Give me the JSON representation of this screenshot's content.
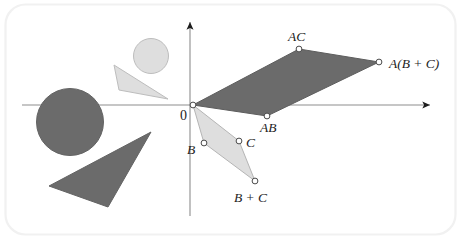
{
  "figure": {
    "kind": "geometric-diagram",
    "canvas": {
      "width": 462,
      "height": 240,
      "background": "#ffffff"
    },
    "frame": {
      "stroke": "#f0f0f0",
      "radius": 20,
      "x": 5,
      "y": 4,
      "width": 450,
      "height": 230
    }
  },
  "colors": {
    "dark_fill": "#6b6b6b",
    "dark_stroke": "#5d5d5d",
    "light_fill": "#dedede",
    "light_stroke": "#b8b8b8",
    "axis": "#8a8a8a",
    "axis_arrow": "#1d1d1d",
    "marker_fill": "#ffffff",
    "marker_stroke": "#4a4a4a",
    "label_color": "#1d1d1d"
  },
  "axes": {
    "x_axis": {
      "label": "",
      "from_x": 22,
      "to_x": 432,
      "y": 105,
      "arrow": "right"
    },
    "y_axis": {
      "label": "",
      "x": 190,
      "from_y": 216,
      "to_y": 20,
      "arrow": "up"
    },
    "origin": {
      "label": "0",
      "x": 193,
      "y": 105,
      "label_x": 180,
      "label_y": 119
    }
  },
  "shapes": [
    {
      "name": "light-circle",
      "type": "circle",
      "tone": "light",
      "cx": 151,
      "cy": 56,
      "r": 17.5
    },
    {
      "name": "light-triangle",
      "type": "triangle",
      "tone": "light",
      "points": "114,65 119,90 168,99"
    },
    {
      "name": "dark-circle",
      "type": "circle",
      "tone": "dark",
      "cx": 70,
      "cy": 122,
      "r": 33.5
    },
    {
      "name": "dark-triangle",
      "type": "triangle",
      "tone": "dark",
      "points": "151,132 49,186 108,207"
    }
  ],
  "parallelograms": [
    {
      "name": "dark-parallelogram",
      "tone": "dark",
      "points": "193,105 267,116 379,62 299,49",
      "vertices": [
        {
          "point_label": "AC",
          "x": 299,
          "y": 49,
          "label_x": 289,
          "label_y": 41,
          "anchor": "start"
        },
        {
          "point_label": "A(B + C)",
          "x": 379,
          "y": 62,
          "label_x": 389,
          "label_y": 67,
          "anchor": "start"
        },
        {
          "point_label": "AB",
          "x": 267,
          "y": 116,
          "label_x": 261,
          "label_y": 131,
          "anchor": "start"
        }
      ]
    },
    {
      "name": "light-parallelogram",
      "tone": "light",
      "points": "193,105 204,143 255,181 239,141",
      "vertices": [
        {
          "point_label": "B",
          "x": 204,
          "y": 143,
          "label_x": 188,
          "label_y": 153,
          "anchor": "start"
        },
        {
          "point_label": "C",
          "x": 239,
          "y": 141,
          "label_x": 246,
          "label_y": 146,
          "anchor": "start"
        },
        {
          "point_label": "B + C",
          "x": 255,
          "y": 181,
          "label_x": 234,
          "label_y": 201,
          "anchor": "start"
        }
      ]
    }
  ]
}
